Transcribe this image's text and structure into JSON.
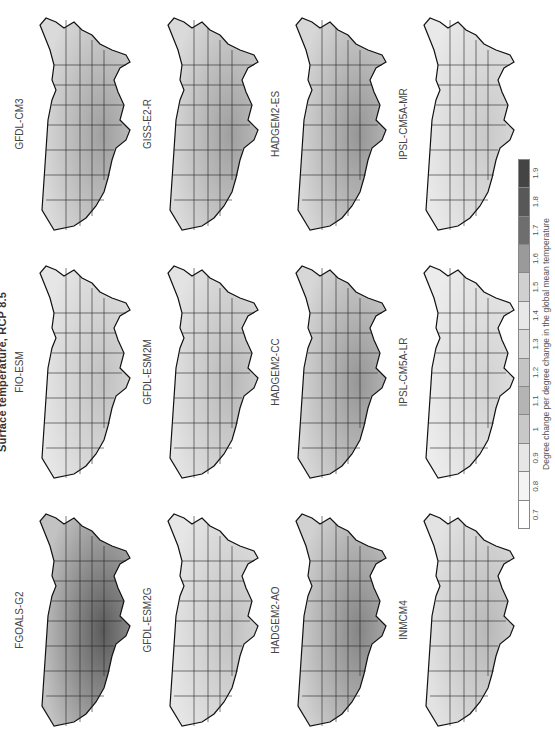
{
  "title": "Surface temperature, RCP 8.5",
  "orientation": "rotated -90 degrees (landscape figure shown in portrait)",
  "panels": [
    {
      "label": "FGOALS-G2",
      "row": 0,
      "col": 0,
      "intensity": 0.85
    },
    {
      "label": "FIO-ESM",
      "row": 0,
      "col": 1,
      "intensity": 0.25
    },
    {
      "label": "GFDL-CM3",
      "row": 0,
      "col": 2,
      "intensity": 0.45
    },
    {
      "label": "GFDL-ESM2G",
      "row": 1,
      "col": 0,
      "intensity": 0.25
    },
    {
      "label": "GFDL-ESM2M",
      "row": 1,
      "col": 1,
      "intensity": 0.3
    },
    {
      "label": "GISS-E2-R",
      "row": 1,
      "col": 2,
      "intensity": 0.45
    },
    {
      "label": "HADGEM2-AO",
      "row": 2,
      "col": 0,
      "intensity": 0.6
    },
    {
      "label": "HADGEM2-CC",
      "row": 2,
      "col": 1,
      "intensity": 0.5
    },
    {
      "label": "HADGEM2-ES",
      "row": 2,
      "col": 2,
      "intensity": 0.5
    },
    {
      "label": "INMCM4",
      "row": 3,
      "col": 0,
      "intensity": 0.3
    },
    {
      "label": "IPSL-CM5A-LR",
      "row": 3,
      "col": 1,
      "intensity": 0.15
    },
    {
      "label": "IPSL-CM5A-MR",
      "row": 3,
      "col": 2,
      "intensity": 0.2
    }
  ],
  "legend": {
    "ticks": [
      "0.7",
      "0.8",
      "0.9",
      "1",
      "1.1",
      "1.2",
      "1.3",
      "1.4",
      "1.5",
      "1.6",
      "1.7",
      "1.8",
      "1.9"
    ],
    "colors": [
      "#ffffff",
      "#f4f4f4",
      "#e6e6e6",
      "#c8c8c8",
      "#b4b4b4",
      "#c4c4c4",
      "#d8d8d8",
      "#e8e8e8",
      "#d0d0d0",
      "#9a9a9a",
      "#6e6e6e",
      "#585858",
      "#444444"
    ],
    "caption": "Degree change per degree change in the global mean temperature"
  },
  "chart_data": {
    "type": "heatmap",
    "title": "Surface temperature, RCP 8.5",
    "panels": [
      "FGOALS-G2",
      "FIO-ESM",
      "GFDL-CM3",
      "GFDL-ESM2G",
      "GFDL-ESM2M",
      "GISS-E2-R",
      "HADGEM2-AO",
      "HADGEM2-CC",
      "HADGEM2-ES",
      "INMCM4",
      "IPSL-CM5A-LR",
      "IPSL-CM5A-MR"
    ],
    "layout": {
      "rows": 4,
      "cols": 3
    },
    "colorbar": {
      "label": "Degree change per degree change in the global mean temperature",
      "ticks": [
        0.7,
        0.8,
        0.9,
        1.0,
        1.1,
        1.2,
        1.3,
        1.4,
        1.5,
        1.6,
        1.7,
        1.8,
        1.9
      ],
      "range": [
        0.7,
        1.9
      ]
    },
    "approx_mean_intensity": {
      "FGOALS-G2": 1.8,
      "FIO-ESM": 1.2,
      "GFDL-CM3": 1.4,
      "GFDL-ESM2G": 1.2,
      "GFDL-ESM2M": 1.3,
      "GISS-E2-R": 1.4,
      "HADGEM2-AO": 1.6,
      "HADGEM2-CC": 1.5,
      "HADGEM2-ES": 1.5,
      "INMCM4": 1.3,
      "IPSL-CM5A-LR": 1.1,
      "IPSL-CM5A-MR": 1.2
    }
  }
}
